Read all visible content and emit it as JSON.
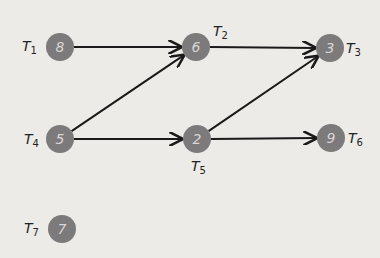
{
  "diagram": {
    "type": "directed-graph",
    "node_color": "#7c7a7a",
    "edge_color": "#1a1a1a",
    "background": "#ecebe8",
    "nodes": [
      {
        "id": "T1",
        "value": "8",
        "label": "T",
        "sub": "1",
        "x": 60,
        "y": 47,
        "lx": 22,
        "ly": 38
      },
      {
        "id": "T2",
        "value": "6",
        "label": "T",
        "sub": "2",
        "x": 196,
        "y": 47,
        "lx": 213,
        "ly": 23
      },
      {
        "id": "T3",
        "value": "3",
        "label": "T",
        "sub": "3",
        "x": 330,
        "y": 48,
        "lx": 346,
        "ly": 40
      },
      {
        "id": "T4",
        "value": "5",
        "label": "T",
        "sub": "4",
        "x": 60,
        "y": 139,
        "lx": 24,
        "ly": 131
      },
      {
        "id": "T5",
        "value": "2",
        "label": "T",
        "sub": "5",
        "x": 197,
        "y": 139,
        "lx": 191,
        "ly": 158
      },
      {
        "id": "T6",
        "value": "9",
        "label": "T",
        "sub": "6",
        "x": 331,
        "y": 138,
        "lx": 348,
        "ly": 130
      },
      {
        "id": "T7",
        "value": "7",
        "label": "T",
        "sub": "7",
        "x": 62,
        "y": 229,
        "lx": 24,
        "ly": 220
      }
    ],
    "edges": [
      {
        "from": "T1",
        "to": "T2"
      },
      {
        "from": "T4",
        "to": "T2"
      },
      {
        "from": "T4",
        "to": "T5"
      },
      {
        "from": "T2",
        "to": "T3"
      },
      {
        "from": "T5",
        "to": "T3"
      },
      {
        "from": "T5",
        "to": "T6"
      }
    ]
  }
}
